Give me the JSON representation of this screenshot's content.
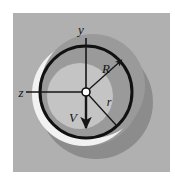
{
  "figure": {
    "type": "technical-diagram",
    "canvas": {
      "width": 175,
      "height": 179
    },
    "panel": {
      "x": 13,
      "y": 13,
      "width": 157,
      "height": 159,
      "fill": "#b0b0b0"
    },
    "colors": {
      "page_background": "#ffffff",
      "panel_background": "#b0b0b0",
      "shadow_gray": "#8c8c8c",
      "mid_gray": "#9a9a9a",
      "inner_light_gray": "#c4c4c4",
      "highlight_white": "#f2f2f2",
      "outline_black": "#111111",
      "axis_black": "#161616"
    },
    "geometry": {
      "center": {
        "x": 86,
        "y": 92
      },
      "outer_radius": 46,
      "outer_stroke_width": 3,
      "inner_circle": {
        "cx": 80,
        "cy": 96,
        "r": 33
      },
      "shadow_circle": {
        "cx": 96,
        "cy": 102,
        "r": 57
      },
      "highlight_band": {
        "cx": 84,
        "cy": 94,
        "r": 52
      }
    },
    "axes": [
      {
        "name": "y-axis",
        "label": "y",
        "label_x": 81,
        "label_y": 34,
        "x1": 86,
        "y1": 38,
        "x2": 86,
        "y2": 92,
        "arrow": "none"
      },
      {
        "name": "z-axis",
        "label": "z",
        "label_x": 21,
        "label_y": 97,
        "x1": 26,
        "y1": 92,
        "x2": 86,
        "y2": 92,
        "arrow": "none"
      }
    ],
    "vectors": [
      {
        "name": "velocity-vector",
        "label": "V",
        "label_x": 73,
        "label_y": 122,
        "x1": 86,
        "y1": 92,
        "x2": 86,
        "y2": 131,
        "arrow": "end"
      },
      {
        "name": "radius-R-vector",
        "label": "R",
        "label_x": 106,
        "label_y": 73,
        "x1": 86,
        "y1": 92,
        "x2": 124,
        "y2": 58,
        "arrow": "end"
      },
      {
        "name": "radius-r-vector",
        "label": "r",
        "label_x": 109,
        "label_y": 106,
        "x1": 86,
        "y1": 92,
        "x2": 116,
        "y2": 125,
        "arrow": "none"
      }
    ],
    "center_marker": {
      "name": "origin-dot",
      "cx": 86,
      "cy": 92,
      "r": 4,
      "fill": "#ffffff",
      "stroke": "#111111"
    },
    "labels": {
      "y_axis": "y",
      "z_axis": "z",
      "velocity": "V",
      "outer_radius": "R",
      "inner_radius": "r"
    }
  }
}
